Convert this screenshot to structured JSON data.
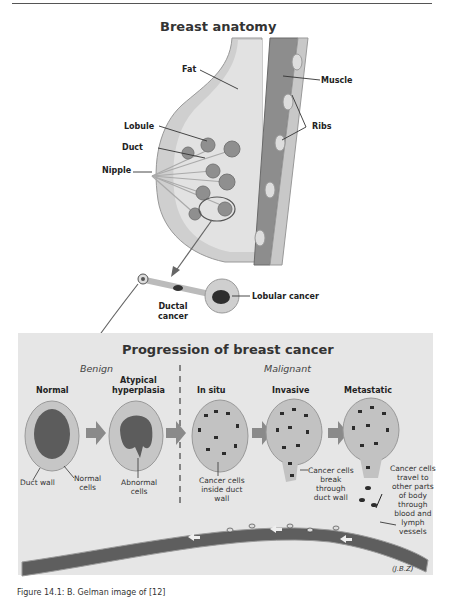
{
  "page": {
    "top_rule": true,
    "caption": "Figure 14.1: B. Gelman image of [12]"
  },
  "anatomy": {
    "title": "Breast anatomy",
    "labels": {
      "fat": "Fat",
      "muscle": "Muscle",
      "lobule": "Lobule",
      "ribs": "Ribs",
      "duct": "Duct",
      "nipple": "Nipple",
      "ductal_cancer_line1": "Ductal",
      "ductal_cancer_line2": "cancer",
      "lobular_cancer": "Lobular cancer"
    }
  },
  "progression": {
    "title": "Progression of breast cancer",
    "groups": {
      "benign": "Benign",
      "malignant": "Malignant"
    },
    "stages": [
      {
        "name_line1": "Normal",
        "name_line2": ""
      },
      {
        "name_line1": "Atypical",
        "name_line2": "hyperplasia"
      },
      {
        "name_line1": "In situ",
        "name_line2": ""
      },
      {
        "name_line1": "Invasive",
        "name_line2": ""
      },
      {
        "name_line1": "Metastatic",
        "name_line2": ""
      }
    ],
    "annotations": {
      "duct_wall": "Duct wall",
      "normal_cells_1": "Normal",
      "normal_cells_2": "cells",
      "abnormal_cells_1": "Abnormal",
      "abnormal_cells_2": "cells",
      "insitu_1": "Cancer cells",
      "insitu_2": "inside duct",
      "insitu_3": "wall",
      "invasive_1": "Cancer cells",
      "invasive_2": "break",
      "invasive_3": "through",
      "invasive_4": "duct wall",
      "meta_1": "Cancer cells",
      "meta_2": "travel to",
      "meta_3": "other parts",
      "meta_4": "of body",
      "meta_5": "through",
      "meta_6": "blood and",
      "meta_7": "lymph",
      "meta_8": "vessels"
    },
    "signature": "(J.B.Z)"
  },
  "colors": {
    "panel_bg": "#e6e6e6",
    "tissue": "#d2d2d2",
    "dark": "#555555",
    "lobule": "#8a8a8a"
  }
}
